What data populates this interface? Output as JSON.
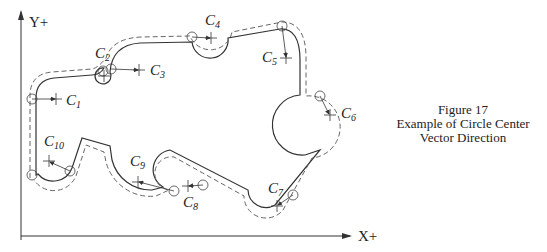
{
  "figure": {
    "caption_lines": [
      "Figure 17",
      "Example of Circle Center",
      "Vector Direction"
    ]
  },
  "axes": {
    "y_label": "Y+",
    "x_label": "X+"
  },
  "circle_centers": [
    {
      "letter": "C",
      "sub": "1"
    },
    {
      "letter": "C",
      "sub": "2"
    },
    {
      "letter": "C",
      "sub": "3"
    },
    {
      "letter": "C",
      "sub": "4"
    },
    {
      "letter": "C",
      "sub": "5"
    },
    {
      "letter": "C",
      "sub": "6"
    },
    {
      "letter": "C",
      "sub": "7"
    },
    {
      "letter": "C",
      "sub": "8"
    },
    {
      "letter": "C",
      "sub": "9"
    },
    {
      "letter": "C",
      "sub": "10"
    }
  ],
  "colors": {
    "line": "#333333",
    "dashed": "#666666"
  }
}
